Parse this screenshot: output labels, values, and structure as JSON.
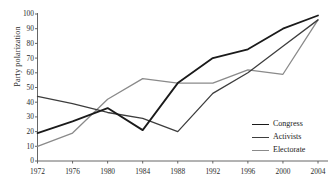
{
  "chart_data": {
    "type": "line",
    "title": "",
    "subtitle": "",
    "xlabel": "",
    "ylabel": "Party polarization",
    "categories": [
      "1972",
      "1976",
      "1980",
      "1984",
      "1988",
      "1992",
      "1996",
      "2000",
      "2004"
    ],
    "x": [
      1972,
      1976,
      1980,
      1984,
      1988,
      1992,
      1996,
      2000,
      2004
    ],
    "xlim": [
      1972,
      2004
    ],
    "ylim": [
      0,
      100
    ],
    "yticks": [
      0,
      10,
      20,
      30,
      40,
      50,
      60,
      70,
      80,
      90,
      100
    ],
    "ytick_labels": [
      "0",
      "10",
      "20",
      "30",
      "40",
      "50",
      "60",
      "70",
      "80",
      "90",
      "100"
    ],
    "grid": false,
    "legend_position": "bottom-right",
    "series": [
      {
        "name": "Congress",
        "color": "#1a1a1a",
        "width": 1.8,
        "values": [
          19,
          27,
          36,
          21,
          53,
          70,
          76,
          90,
          99
        ]
      },
      {
        "name": "Activists",
        "color": "#3d3d3d",
        "width": 1.3,
        "values": [
          44,
          39,
          33,
          29,
          20,
          46,
          60,
          78,
          96
        ]
      },
      {
        "name": "Electorate",
        "color": "#8a8a8a",
        "width": 1.3,
        "values": [
          10,
          19,
          42,
          56,
          53,
          53,
          62,
          59,
          96
        ]
      }
    ]
  },
  "axis": {
    "line_color": "#555555",
    "tick_color": "#555555"
  },
  "legend": {
    "entries": [
      {
        "label": "Congress"
      },
      {
        "label": "Activists"
      },
      {
        "label": "Electorate"
      }
    ]
  }
}
